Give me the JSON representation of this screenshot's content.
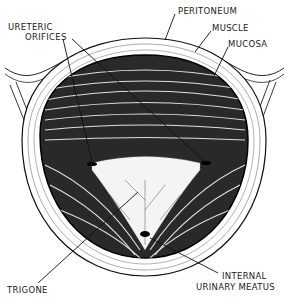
{
  "diagram": {
    "labels": {
      "peritoneum": "PERITONEUM",
      "muscle": "MUSCLE",
      "mucosa": "MUCOSA",
      "ureteric_1": "URETERIC",
      "ureteric_2": "ORIFICES",
      "trigone": "TRIGONE",
      "internal_1": "INTERNAL",
      "internal_2": "URINARY MEATUS"
    },
    "colors": {
      "ink": "#1a1a1a",
      "background": "#ffffff"
    }
  }
}
